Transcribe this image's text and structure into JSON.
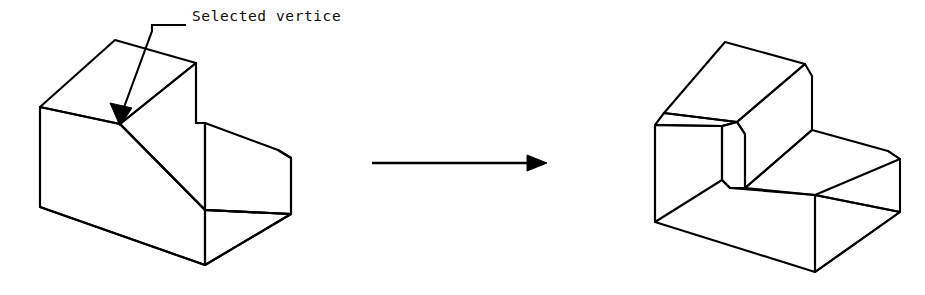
{
  "figure": {
    "background_color": "#ffffff",
    "line_color": "#000000",
    "line_width": 2.1,
    "width": 925,
    "height": 295
  },
  "annotation": {
    "label": "Selected vertice",
    "label_x": 192,
    "label_y": 16,
    "leader_points": "152,25 186,25",
    "leader_elbow": "152,25 152,30",
    "leader_stem": "152,30 122,113",
    "arrow_tip_x": 120,
    "arrow_tip_y": 124,
    "arrow_polygon": "120,124 112,104 131,107"
  },
  "transition_arrow": {
    "name": "transition-arrow",
    "shaft": "372,163 532,163",
    "head": "546,163 528,156 528,170",
    "direction": "right"
  },
  "left_shape": {
    "name": "stepped-block-original",
    "caption": "L-shaped stepped block with selected concave vertex",
    "top_upper_face": "40,107 115,40 196,63 120,124",
    "top_lower_face": "120,124 196,63 278,150 205,210",
    "top_right_face": "196,63 205,123 278,150",
    "left_face": "40,107 120,124 205,210 205,265 40,207",
    "front_face": "205,210 205,265 291,214 291,158 278,150",
    "right_face": "278,150 291,158 291,214",
    "outline": "40,107 115,40 196,63 196,123 278,150 291,158 291,214 205,265 40,207 40,107",
    "edges": [
      "40,107 115,40",
      "115,40 196,63",
      "196,63 120,124",
      "120,124 40,107",
      "120,124 205,210",
      "196,63 196,123",
      "196,123 278,150",
      "278,150 291,158",
      "291,158 291,214",
      "291,214 205,265",
      "205,265 40,207",
      "40,207 40,107",
      "205,210 205,265",
      "205,210 291,214",
      "196,123 205,123"
    ]
  },
  "right_shape": {
    "name": "stepped-block-chamfered",
    "caption": "Same block after chamfer applied at the selected vertex",
    "outline": "655,125 663,113 725,42 805,64 805,122 888,151 900,159 900,212 815,272 655,222 655,125",
    "edges": [
      "655,125 725,42",
      "725,42 805,64",
      "805,64 737,122",
      "737,122 664,113",
      "664,113 655,125",
      "664,113 725,42",
      "737,122 745,134",
      "745,134 745,188",
      "745,188 815,195",
      "737,122 805,64",
      "805,64 812,76",
      "812,76 812,130",
      "812,130 745,188",
      "745,188 730,188",
      "730,188 722,180",
      "722,180 722,126",
      "722,126 737,122",
      "722,126 664,113",
      "722,180 655,222",
      "655,222 655,125",
      "812,130 888,151",
      "888,151 900,159",
      "900,159 900,212",
      "900,212 815,272",
      "815,272 655,222",
      "815,195 815,272",
      "815,195 900,212"
    ],
    "chamfer_bands": [
      "655,125 664,113 725,42 805,64 812,76 737,122",
      "722,126 737,122 745,134 745,188 730,188 722,180"
    ]
  }
}
